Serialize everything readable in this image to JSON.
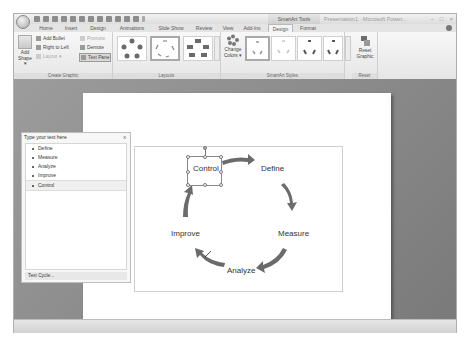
{
  "window": {
    "title": "Presentation1 - Microsoft Power...",
    "contextual_tools": "SmartArt Tools",
    "controls": [
      "minimize",
      "maximize",
      "close"
    ]
  },
  "quick_access": [
    "save-icon",
    "undo-icon",
    "redo-icon",
    "open-icon",
    "new-icon",
    "close-icon",
    "print-icon",
    "print-preview-icon",
    "spelling-icon",
    "format-painter-icon",
    "slideshow-icon",
    "table-icon",
    "customize-icon"
  ],
  "tabs": [
    {
      "label": "Home"
    },
    {
      "label": "Insert"
    },
    {
      "label": "Design"
    },
    {
      "label": "Animations"
    },
    {
      "label": "Slide Show"
    },
    {
      "label": "Review"
    },
    {
      "label": "View"
    },
    {
      "label": "Add-Ins"
    },
    {
      "label": "Design",
      "active": true
    },
    {
      "label": "Format"
    }
  ],
  "ribbon": {
    "create_graphic": {
      "label": "Create Graphic",
      "add_shape": "Add Shape",
      "add_bullet": "Add Bullet",
      "right_to_left": "Right to Left",
      "layout": "Layout",
      "promote": "Promote",
      "demote": "Demote",
      "text_pane": "Text Pane"
    },
    "layouts": {
      "label": "Layouts",
      "items": [
        "Basic Cycle",
        "Text Cycle",
        "Block Cycle"
      ],
      "selected": 1
    },
    "smartart_styles": {
      "label": "SmartArt Styles",
      "change_colors": "Change Colors",
      "items": [
        "Simple Fill",
        "White Outline",
        "Subtle Effect",
        "Moderate Effect",
        "Intense Effect"
      ],
      "selected": 0
    },
    "reset": {
      "label": "Reset",
      "reset_graphic": "Reset Graphic"
    }
  },
  "text_pane": {
    "title": "Type your text here",
    "close": "x",
    "items": [
      "Define",
      "Measure",
      "Analyze",
      "Improve",
      "Control"
    ],
    "selected_index": 4,
    "footer": "Text Cycle..."
  },
  "smartart": {
    "nodes": [
      "Define",
      "Measure",
      "Analyze",
      "Improve",
      "Control"
    ],
    "selected_node": "Control",
    "arrow_color": "#6b6b6b"
  }
}
